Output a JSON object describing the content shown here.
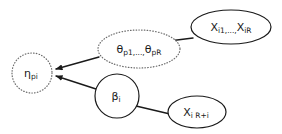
{
  "diagram": {
    "background_color": "#ffffff",
    "line_color": "#1a1a1a",
    "dotted_node_color": "#6b6b6b",
    "nodes": [
      {
        "id": "eta",
        "name": "eta-pi-node",
        "shape": "circle",
        "border": "dotted",
        "cx": 32,
        "cy": 73,
        "rx": 20,
        "ry": 20,
        "label_main": "η",
        "label_sub": "pi",
        "label_full": "ηpi"
      },
      {
        "id": "theta",
        "name": "theta-p1-pR-node",
        "shape": "ellipse",
        "border": "dotted",
        "cx": 139,
        "cy": 49,
        "rx": 41,
        "ry": 19,
        "label_main": "θ",
        "label_sub": "p1",
        "label_mid": ",...,",
        "label_main2": "θ",
        "label_sub2": "pR",
        "label_full": "θp1,...,θpR"
      },
      {
        "id": "beta",
        "name": "beta-i-node",
        "shape": "circle",
        "border": "solid",
        "cx": 117,
        "cy": 96,
        "rx": 22,
        "ry": 22,
        "label_main": "β",
        "label_sub": "i",
        "label_full": "βi"
      },
      {
        "id": "x_i1_iR",
        "name": "x-i1-iR-node",
        "shape": "ellipse",
        "border": "solid",
        "cx": 231,
        "cy": 27,
        "rx": 40,
        "ry": 17,
        "label_main": "X",
        "label_sub": "i1",
        "label_mid": ",...,",
        "label_main2": "X",
        "label_sub2": "iR",
        "label_full": "Xi1,...,XiR"
      },
      {
        "id": "x_i_Rplusi",
        "name": "x-i-R-plus-i-node",
        "shape": "ellipse",
        "border": "solid",
        "cx": 197,
        "cy": 112,
        "rx": 29,
        "ry": 16,
        "label_main": "X",
        "label_sub": "i R+i",
        "label_full": "Xi R+i"
      }
    ],
    "edges": [
      {
        "id": "theta-to-eta",
        "name": "edge-theta-to-eta",
        "from": "theta",
        "to": "eta",
        "arrow": true,
        "x1": 99,
        "y1": 57,
        "x2": 54,
        "y2": 69
      },
      {
        "id": "beta-to-eta",
        "name": "edge-beta-to-eta",
        "from": "beta",
        "to": "eta",
        "arrow": true,
        "x1": 96,
        "y1": 89,
        "x2": 54,
        "y2": 76
      },
      {
        "id": "x-i1-iR-to-theta",
        "name": "edge-x-i1-iR-to-theta",
        "from": "x_i1_iR",
        "to": "theta",
        "arrow": false,
        "x1": 193,
        "y1": 38,
        "x2": 169,
        "y2": 41
      },
      {
        "id": "beta-to-x-i-R-plus-i",
        "name": "edge-beta-to-x-i-R-plus-i",
        "from": "beta",
        "to": "x_i_Rplusi",
        "arrow": false,
        "x1": 136,
        "y1": 106,
        "x2": 170,
        "y2": 114
      }
    ]
  }
}
